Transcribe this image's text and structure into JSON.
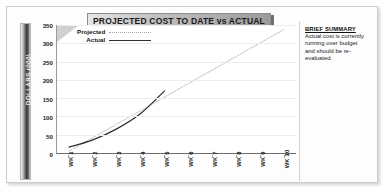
{
  "slide": {
    "title": "PROJECTED COST TO DATE vs ACTUAL"
  },
  "summary": {
    "heading": "BRIEF SUMMARY",
    "body": "Actual cost is currently running over budget and should be re-evaluated."
  },
  "legend": {
    "projected_label": "Projected",
    "actual_label": "Actual"
  },
  "axes": {
    "y_title": "DOLLARS (000)"
  },
  "chart_data": {
    "type": "line",
    "title": "PROJECTED COST TO DATE vs ACTUAL",
    "xlabel": "",
    "ylabel": "DOLLARS (000)",
    "ylim": [
      0,
      350
    ],
    "yticks": [
      0,
      50,
      100,
      150,
      200,
      250,
      300,
      350
    ],
    "ytick_labels": [
      "0",
      "50",
      "100",
      "150",
      "200",
      "250",
      "300",
      "350"
    ],
    "grid": true,
    "legend_position": "top-left",
    "categories": [
      "WK 1",
      "WK 2",
      "WK 3",
      "WK 4",
      "WK 5",
      "WK 6",
      "WK 7",
      "WK 8",
      "WK 9",
      "WK 10"
    ],
    "series": [
      {
        "name": "Projected",
        "style": "dotted",
        "color": "#a8a8a8",
        "values": [
          5,
          42,
          79,
          116,
          153,
          190,
          227,
          264,
          301,
          338
        ]
      },
      {
        "name": "Actual",
        "style": "solid",
        "color": "#2f2f2f",
        "values": [
          16,
          36,
          66,
          108,
          170,
          null,
          null,
          null,
          null,
          null
        ]
      }
    ]
  }
}
